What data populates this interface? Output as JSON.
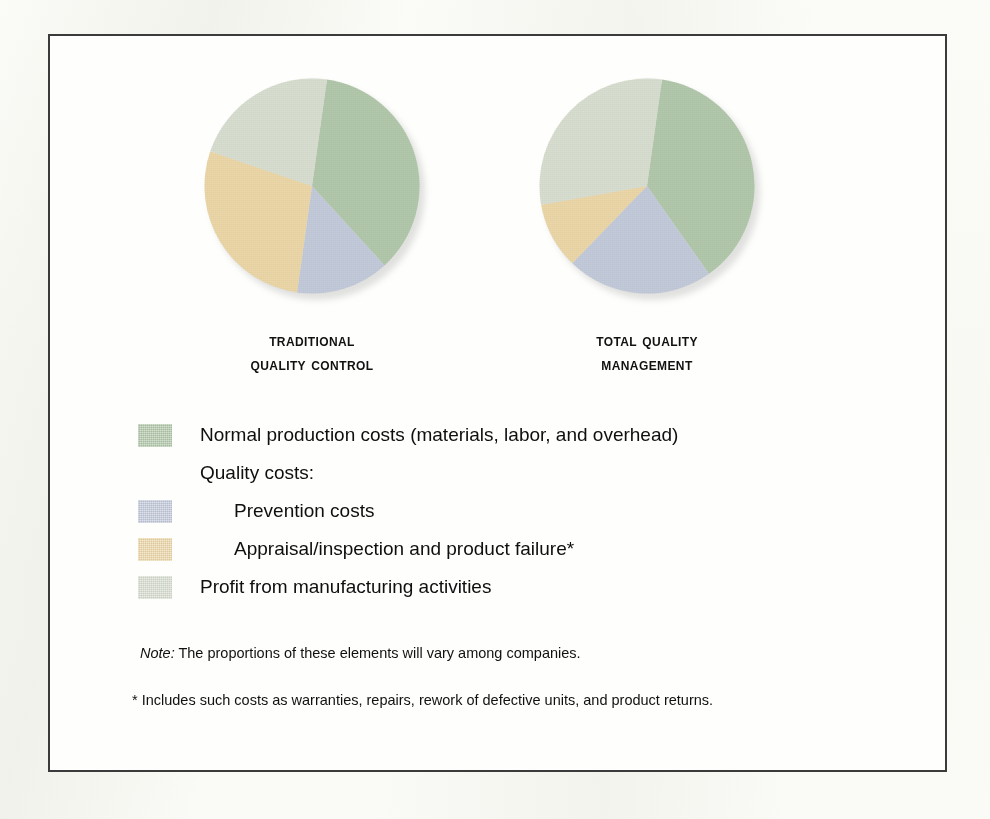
{
  "figure": {
    "captions": [
      {
        "line1": "Traditional",
        "line2": "Quality Control"
      },
      {
        "line1": "Total Quality",
        "line2": "Management"
      }
    ],
    "note_lead": "Note:",
    "note_text": " The proportions of these elements will vary among companies.",
    "footnote": "* Includes such costs as warranties, repairs, rework of defective units, and product returns."
  },
  "colors": {
    "normal_production": "#b2c8ab",
    "prevention": "#c3cada",
    "appraisal_failure": "#ecd7a8",
    "profit": "#d8ded0",
    "frame": "#3b3b3b",
    "text": "#111111"
  },
  "legend": {
    "rows": [
      {
        "label": "Normal production costs (materials, labor, and overhead)",
        "color": "#b2c8ab",
        "swatch": true,
        "indent": false
      },
      {
        "label": "Quality costs:",
        "color": null,
        "swatch": false,
        "indent": false
      },
      {
        "label": "Prevention costs",
        "color": "#c3cada",
        "swatch": true,
        "indent": true
      },
      {
        "label": "Appraisal/inspection and product failure*",
        "color": "#ecd7a8",
        "swatch": true,
        "indent": true
      },
      {
        "label": "Profit from manufacturing activities",
        "color": "#d8ded0",
        "swatch": true,
        "indent": false
      }
    ]
  },
  "chart_data": [
    {
      "type": "pie",
      "title": "Traditional Quality Control",
      "labels": [
        "Normal production costs (materials, labor, and overhead)",
        "Prevention costs",
        "Appraisal/inspection and product failure*",
        "Profit from manufacturing activities"
      ],
      "values": [
        36,
        14,
        28,
        22
      ],
      "colors": [
        "#b2c8ab",
        "#c3cada",
        "#ecd7a8",
        "#d8ded0"
      ],
      "start_angle_deg": 8,
      "legend_position": "below",
      "grid": false
    },
    {
      "type": "pie",
      "title": "Total Quality Management",
      "labels": [
        "Normal production costs (materials, labor, and overhead)",
        "Prevention costs",
        "Appraisal/inspection and product failure*",
        "Profit from manufacturing activities"
      ],
      "values": [
        38,
        22,
        10,
        30
      ],
      "colors": [
        "#b2c8ab",
        "#c3cada",
        "#ecd7a8",
        "#d8ded0"
      ],
      "start_angle_deg": 8,
      "legend_position": "below",
      "grid": false
    }
  ]
}
